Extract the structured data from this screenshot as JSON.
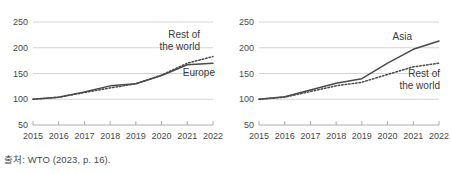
{
  "source_note": "출처: WTO (2023, p. 16).",
  "chart_data": [
    {
      "type": "line",
      "title": "",
      "xlabel": "",
      "ylabel": "",
      "x": [
        2015,
        2016,
        2017,
        2018,
        2019,
        2020,
        2021,
        2022
      ],
      "tick_labels": [
        "2015",
        "2016",
        "2017",
        "2018",
        "2019",
        "2020",
        "2021",
        "2022"
      ],
      "ylim": [
        50,
        250
      ],
      "yticks": [
        50,
        100,
        150,
        200,
        250
      ],
      "ytick_labels": [
        "50",
        "100",
        "150",
        "200",
        "250"
      ],
      "grid": true,
      "legend_position": "inline-right",
      "series": [
        {
          "name": "Europe",
          "style": "solid",
          "label_lines": [
            "Europe"
          ],
          "values": [
            100,
            104,
            114,
            126,
            130,
            146,
            167,
            170
          ]
        },
        {
          "name": "Rest of the world",
          "style": "dotted",
          "label_lines": [
            "Rest of",
            "the world"
          ],
          "values": [
            100,
            104,
            113,
            122,
            130,
            147,
            170,
            183
          ]
        }
      ]
    },
    {
      "type": "line",
      "title": "",
      "xlabel": "",
      "ylabel": "",
      "x": [
        2015,
        2016,
        2017,
        2018,
        2019,
        2020,
        2021,
        2022
      ],
      "tick_labels": [
        "2015",
        "2016",
        "2017",
        "2018",
        "2019",
        "2020",
        "2021",
        "2022"
      ],
      "ylim": [
        50,
        250
      ],
      "yticks": [
        50,
        100,
        150,
        200,
        250
      ],
      "ytick_labels": [
        "50",
        "100",
        "150",
        "200",
        "250"
      ],
      "grid": true,
      "legend_position": "inline-right",
      "series": [
        {
          "name": "Asia",
          "style": "solid",
          "label_lines": [
            "Asia"
          ],
          "values": [
            100,
            105,
            118,
            131,
            140,
            170,
            197,
            213
          ]
        },
        {
          "name": "Rest of the world",
          "style": "dotted",
          "label_lines": [
            "Rest of",
            "the world"
          ],
          "values": [
            100,
            104,
            115,
            126,
            133,
            148,
            163,
            170
          ]
        }
      ]
    }
  ],
  "colors": {
    "line": "#4a4a4a",
    "grid": "#c9c9c9",
    "axis": "#9a9a9a",
    "text": "#4a4a4a",
    "background": "#ffffff"
  }
}
